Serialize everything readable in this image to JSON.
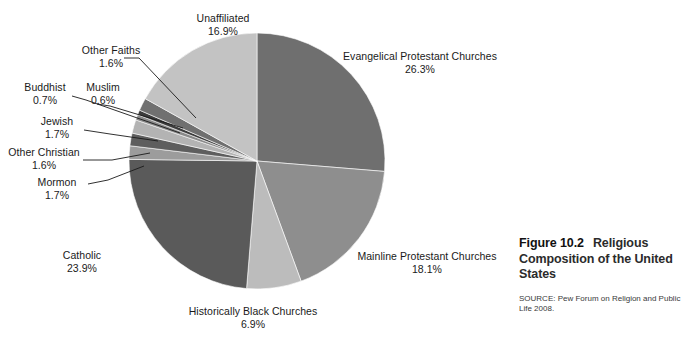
{
  "figure": {
    "number_label": "Figure 10.2",
    "title": "Religious Composition of the United States",
    "source": "SOURCE: Pew Forum on Religion and Public Life 2008."
  },
  "chart_data": {
    "type": "pie",
    "title": "Religious Composition of the United States",
    "start_angle_deg": 0,
    "direction": "clockwise",
    "legend": "none",
    "labels_placement": "outside-with-leader-lines",
    "units": "percent",
    "categories": [
      "Evangelical Protestant Churches",
      "Mainline Protestant Churches",
      "Historically Black Churches",
      "Catholic",
      "Mormon",
      "Other Christian",
      "Jewish",
      "Buddhist",
      "Muslim",
      "Other Faiths",
      "Unaffiliated"
    ],
    "values": [
      26.3,
      18.1,
      6.9,
      23.9,
      1.7,
      1.6,
      1.7,
      0.7,
      0.6,
      1.6,
      16.9
    ],
    "value_labels": [
      "26.3%",
      "18.1%",
      "6.9%",
      "23.9%",
      "1.7%",
      "1.6%",
      "1.7%",
      "0.7%",
      "0.6%",
      "1.6%",
      "16.9%"
    ],
    "colors": [
      "#6f6f6f",
      "#8e8e8e",
      "#bcbcbc",
      "#5a5a5a",
      "#9c9c9c",
      "#5e5e5e",
      "#b3b3b3",
      "#8a8a8a",
      "#3c3c3c",
      "#707070",
      "#c3c3c3"
    ]
  },
  "slices": [
    {
      "name": "Evangelical Protestant Churches",
      "pct": "26.3%"
    },
    {
      "name": "Mainline Protestant Churches",
      "pct": "18.1%"
    },
    {
      "name": "Historically Black Churches",
      "pct": "6.9%"
    },
    {
      "name": "Catholic",
      "pct": "23.9%"
    },
    {
      "name": "Mormon",
      "pct": "1.7%"
    },
    {
      "name": "Other Christian",
      "pct": "1.6%"
    },
    {
      "name": "Jewish",
      "pct": "1.7%"
    },
    {
      "name": "Buddhist",
      "pct": "0.7%"
    },
    {
      "name": "Muslim",
      "pct": "0.6%"
    },
    {
      "name": "Other Faiths",
      "pct": "1.6%"
    },
    {
      "name": "Unaffiliated",
      "pct": "16.9%"
    }
  ]
}
